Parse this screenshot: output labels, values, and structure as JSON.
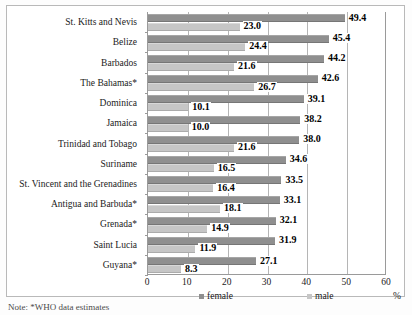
{
  "note": "Note: *WHO data estimates",
  "axis_unit_label": "%",
  "legend": [
    {
      "label": "female",
      "color": "#8f8f8f"
    },
    {
      "label": "male",
      "color": "#c6c6c6"
    }
  ],
  "chart_data": {
    "type": "bar",
    "orientation": "horizontal",
    "title": "",
    "subtitle": "",
    "xlabel": "%",
    "ylabel": "",
    "xlim": [
      0,
      60
    ],
    "xticks": [
      0,
      10,
      20,
      30,
      40,
      50,
      60
    ],
    "xticklabels": [
      "0",
      "10",
      "20",
      "30",
      "40",
      "50",
      "60"
    ],
    "grid": true,
    "grid_axis": "x",
    "legend_position": "bottom",
    "categories": [
      "St. Kitts and Nevis",
      "Belize",
      "Barbados",
      "The Bahamas*",
      "Dominica",
      "Jamaica",
      "Trinidad and Tobago",
      "Suriname",
      "St. Vincent and the Grenadines",
      "Antigua and Barbuda*",
      "Grenada*",
      "Saint Lucia",
      "Guyana*"
    ],
    "series": [
      {
        "name": "female",
        "color": "#8f8f8f",
        "values": [
          49.4,
          45.4,
          44.2,
          42.6,
          39.1,
          38.2,
          38.0,
          34.6,
          33.5,
          33.1,
          32.1,
          31.9,
          27.1
        ]
      },
      {
        "name": "male",
        "color": "#c6c6c6",
        "values": [
          23.0,
          24.4,
          21.6,
          26.7,
          10.1,
          10.0,
          21.6,
          16.5,
          16.4,
          18.1,
          14.9,
          11.9,
          8.3
        ]
      }
    ],
    "data_labels": {
      "female": [
        "49.4",
        "45.4",
        "44.2",
        "42.6",
        "39.1",
        "38.2",
        "38.0",
        "34.6",
        "33.5",
        "33.1",
        "32.1",
        "31.9",
        "27.1"
      ],
      "male": [
        "23.0",
        "24.4",
        "21.6",
        "26.7",
        "10.1",
        "10.0",
        "21.6",
        "16.5",
        "16.4",
        "18.1",
        "14.9",
        "11.9",
        "8.3"
      ]
    }
  }
}
